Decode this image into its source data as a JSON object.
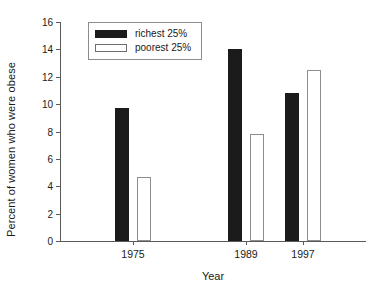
{
  "chart_data": {
    "type": "bar",
    "title": "",
    "xlabel": "Year",
    "ylabel": "Percent of women who were obese",
    "categories": [
      "1975",
      "1989",
      "1997"
    ],
    "series": [
      {
        "name": "richest 25%",
        "values": [
          9.7,
          14.0,
          10.8
        ],
        "color": "#1b1b1b",
        "fill": "solid"
      },
      {
        "name": "poorest 25%",
        "values": [
          4.7,
          7.8,
          12.5
        ],
        "color": "#ffffff",
        "fill": "outline"
      }
    ],
    "ylim": [
      0,
      16
    ],
    "yticks": [
      "0",
      "2",
      "4",
      "6",
      "8",
      "10",
      "12",
      "14",
      "16"
    ],
    "ytick_values": [
      0,
      2,
      4,
      6,
      8,
      10,
      12,
      14,
      16
    ],
    "grid": false,
    "legend_position": "top-left-inside",
    "legend_entries": [
      "richest 25%",
      "poorest 25%"
    ],
    "annotations": []
  },
  "axis": {
    "y_title": "Percent of women who were obese",
    "x_title": "Year"
  }
}
